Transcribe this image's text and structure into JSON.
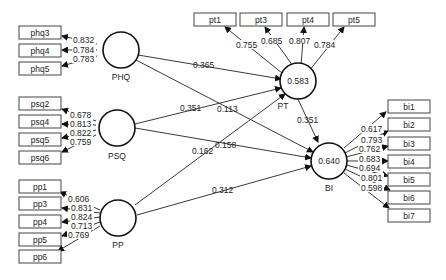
{
  "constructs": {
    "PHQ": {
      "label": "PHQ",
      "r2": ""
    },
    "PSQ": {
      "label": "PSQ",
      "r2": ""
    },
    "PP": {
      "label": "PP",
      "r2": ""
    },
    "PT": {
      "label": "PT",
      "r2": "0.583"
    },
    "BI": {
      "label": "BI",
      "r2": "0.640"
    }
  },
  "indicators": {
    "PHQ": [
      {
        "name": "phq3",
        "loading": "0.832"
      },
      {
        "name": "phq4",
        "loading": "0.784"
      },
      {
        "name": "phq5",
        "loading": "0.783"
      }
    ],
    "PSQ": [
      {
        "name": "psq2",
        "loading": "0.678"
      },
      {
        "name": "psq4",
        "loading": "0.813"
      },
      {
        "name": "psq5",
        "loading": "0.822"
      },
      {
        "name": "psq6",
        "loading": "0.759"
      }
    ],
    "PP": [
      {
        "name": "pp1",
        "loading": "0.606"
      },
      {
        "name": "pp3",
        "loading": "0.831"
      },
      {
        "name": "pp4",
        "loading": "0.824"
      },
      {
        "name": "pp5",
        "loading": "0.713"
      },
      {
        "name": "pp6",
        "loading": "0.769"
      }
    ],
    "PT": [
      {
        "name": "pt1",
        "loading": "0.755"
      },
      {
        "name": "pt3",
        "loading": "0.685"
      },
      {
        "name": "pt4",
        "loading": "0.807"
      },
      {
        "name": "pt5",
        "loading": "0.784"
      }
    ],
    "BI": [
      {
        "name": "bi1",
        "loading": "0.617"
      },
      {
        "name": "bi2",
        "loading": "0.793"
      },
      {
        "name": "bi3",
        "loading": "0.762"
      },
      {
        "name": "bi4",
        "loading": "0.683"
      },
      {
        "name": "bi5",
        "loading": "0.694"
      },
      {
        "name": "bi6",
        "loading": "0.801"
      },
      {
        "name": "bi7",
        "loading": "0.598"
      }
    ]
  },
  "paths": {
    "PHQ_PT": "0.365",
    "PHQ_BI": "0.113",
    "PSQ_PT": "0.351",
    "PSQ_BI": "0.158",
    "PP_PT": "0.162",
    "PP_BI": "0.312",
    "PT_BI": "0.351"
  }
}
